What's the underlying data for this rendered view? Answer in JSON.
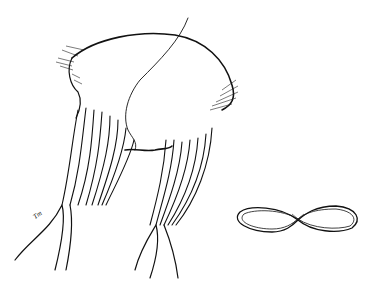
{
  "illustration": {
    "subject": "anatomical line drawing of a heart valve leaflet with chordae tendineae and papillary muscles",
    "signature": "Tm",
    "inset": "figure-eight shaped valve orifice outline"
  },
  "colors": {
    "ink": "#111111",
    "background": "#ffffff"
  }
}
